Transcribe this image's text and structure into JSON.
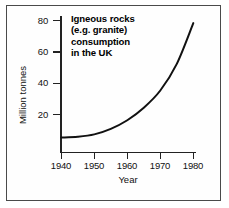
{
  "chart_data": {
    "type": "line",
    "title": "Igneous rocks (e.g. granite) consumption in the UK",
    "title_lines": [
      "Igneous rocks",
      "(e.g. granite)",
      "consumption",
      "in the UK"
    ],
    "xlabel": "Year",
    "ylabel": "Million tonnes",
    "xlim": [
      1940,
      1981
    ],
    "ylim": [
      0,
      87
    ],
    "xticks": [
      1940,
      1950,
      1960,
      1970,
      1980
    ],
    "xticklabels": [
      "1940",
      "1950",
      "1960",
      "1970",
      "1980"
    ],
    "yticks": [
      20,
      40,
      60,
      80
    ],
    "yticklabels": [
      "20",
      "40",
      "60",
      "80"
    ],
    "grid": false,
    "legend": null,
    "series": [
      {
        "name": "Igneous rock consumption",
        "units": "million tonnes",
        "x": [
          1940,
          1945,
          1950,
          1955,
          1960,
          1965,
          1970,
          1975,
          1980
        ],
        "values": [
          5,
          5.5,
          7,
          10.5,
          16,
          24,
          35,
          52,
          78
        ]
      }
    ],
    "line_color": "#111111",
    "line_width": 2.0,
    "background_color": "#ffffff",
    "frame_color": "#4a4a4a"
  }
}
